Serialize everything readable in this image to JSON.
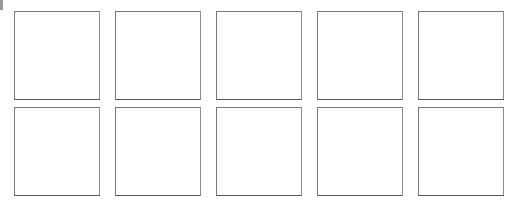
{
  "page": {
    "background_color": "#ffffff",
    "width": 523,
    "height": 212
  },
  "artifacts": {
    "edge_sliver": {
      "name": "clipped-edge-sliver",
      "color": "#9a9a9a"
    }
  },
  "grid": {
    "columns": 5,
    "rows": 2,
    "border_color": "#787878",
    "fill_color": "#ffffff",
    "cells": [
      {
        "id": "cell-1",
        "label": ""
      },
      {
        "id": "cell-2",
        "label": ""
      },
      {
        "id": "cell-3",
        "label": ""
      },
      {
        "id": "cell-4",
        "label": ""
      },
      {
        "id": "cell-5",
        "label": ""
      },
      {
        "id": "cell-6",
        "label": ""
      },
      {
        "id": "cell-7",
        "label": ""
      },
      {
        "id": "cell-8",
        "label": ""
      },
      {
        "id": "cell-9",
        "label": ""
      },
      {
        "id": "cell-10",
        "label": ""
      }
    ]
  }
}
